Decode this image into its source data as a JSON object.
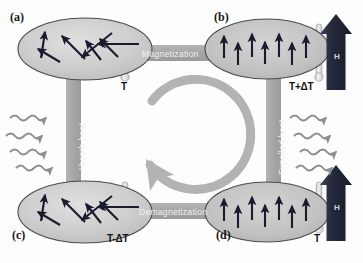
{
  "figure": {
    "width": 363,
    "height": 263,
    "background": "#fdfdfd"
  },
  "colors": {
    "band": "#a9a9a9",
    "band_dark": "#9a9a9a",
    "cycle_arrow": "#b3b3b3",
    "ellipse_fill": "#c8c8c8",
    "ellipse_fill_light": "#d2d2d2",
    "ellipse_stroke": "#4a4a4a",
    "spin_arrow": "#1b1b2e",
    "field_arrow": "#252a3c",
    "heat_wave": "#8e8e8e",
    "thermometer": "#e2e2e2",
    "thermometer_stroke": "#9c9c9c",
    "text_dark": "#141414",
    "text_light": "#f2f2f2"
  },
  "panels": [
    {
      "id": "a",
      "label": "(a)",
      "label_x": 10,
      "label_y": 16,
      "spin_state": "disordered",
      "ellipse": {
        "cx": 85,
        "cy": 49,
        "rx": 67,
        "ry": 31
      },
      "temperature": "T",
      "temperature_x": 121,
      "temperature_y": 79,
      "field_arrow": false,
      "spins": [
        {
          "x1": 41,
          "y1": 58,
          "x2": 45,
          "y2": 32
        },
        {
          "x1": 60,
          "y1": 62,
          "x2": 38,
          "y2": 49
        },
        {
          "x1": 85,
          "y1": 59,
          "x2": 62,
          "y2": 36
        },
        {
          "x1": 101,
          "y1": 60,
          "x2": 86,
          "y2": 41
        },
        {
          "x1": 118,
          "y1": 57,
          "x2": 100,
          "y2": 39
        },
        {
          "x1": 139,
          "y1": 44,
          "x2": 98,
          "y2": 44
        },
        {
          "x1": 112,
          "y1": 33,
          "x2": 82,
          "y2": 57
        }
      ]
    },
    {
      "id": "b",
      "label": "(b)",
      "label_x": 214,
      "label_y": 16,
      "spin_state": "ordered",
      "ellipse": {
        "cx": 267,
        "cy": 49,
        "rx": 62,
        "ry": 30
      },
      "temperature": "T+ΔT",
      "temperature_x": 289,
      "temperature_y": 79,
      "field_arrow": true,
      "spins": [
        {
          "x1": 224,
          "y1": 58,
          "x2": 224,
          "y2": 36
        },
        {
          "x1": 238,
          "y1": 65,
          "x2": 238,
          "y2": 43
        },
        {
          "x1": 252,
          "y1": 57,
          "x2": 252,
          "y2": 34
        },
        {
          "x1": 265,
          "y1": 64,
          "x2": 265,
          "y2": 42
        },
        {
          "x1": 279,
          "y1": 57,
          "x2": 279,
          "y2": 34
        },
        {
          "x1": 292,
          "y1": 65,
          "x2": 292,
          "y2": 43
        },
        {
          "x1": 306,
          "y1": 58,
          "x2": 306,
          "y2": 36
        }
      ]
    },
    {
      "id": "c",
      "label": "(c)",
      "label_x": 12,
      "label_y": 232,
      "spin_state": "disordered",
      "ellipse": {
        "cx": 85,
        "cy": 212,
        "rx": 67,
        "ry": 31
      },
      "temperature": "T-ΔT",
      "temperature_x": 107,
      "temperature_y": 231,
      "field_arrow": false,
      "spins": [
        {
          "x1": 41,
          "y1": 221,
          "x2": 45,
          "y2": 195
        },
        {
          "x1": 60,
          "y1": 225,
          "x2": 38,
          "y2": 212
        },
        {
          "x1": 85,
          "y1": 222,
          "x2": 62,
          "y2": 199
        },
        {
          "x1": 101,
          "y1": 223,
          "x2": 86,
          "y2": 204
        },
        {
          "x1": 118,
          "y1": 220,
          "x2": 100,
          "y2": 202
        },
        {
          "x1": 139,
          "y1": 207,
          "x2": 98,
          "y2": 207
        },
        {
          "x1": 112,
          "y1": 196,
          "x2": 82,
          "y2": 220
        }
      ]
    },
    {
      "id": "d",
      "label": "(d)",
      "label_x": 216,
      "label_y": 232,
      "spin_state": "ordered",
      "ellipse": {
        "cx": 267,
        "cy": 212,
        "rx": 62,
        "ry": 30
      },
      "temperature": "T",
      "temperature_x": 330,
      "temperature_y": 231,
      "field_arrow": true,
      "spins": [
        {
          "x1": 224,
          "y1": 221,
          "x2": 224,
          "y2": 199
        },
        {
          "x1": 238,
          "y1": 228,
          "x2": 238,
          "y2": 206
        },
        {
          "x1": 252,
          "y1": 220,
          "x2": 252,
          "y2": 197
        },
        {
          "x1": 265,
          "y1": 227,
          "x2": 265,
          "y2": 205
        },
        {
          "x1": 279,
          "y1": 220,
          "x2": 279,
          "y2": 197
        },
        {
          "x1": 292,
          "y1": 228,
          "x2": 292,
          "y2": 206
        },
        {
          "x1": 306,
          "y1": 221,
          "x2": 306,
          "y2": 199
        }
      ]
    }
  ],
  "process_bands": [
    {
      "name": "magnetization",
      "label": "Magnetization",
      "orientation": "horizontal",
      "x": 136,
      "y": 45,
      "width": 86,
      "height": 16,
      "label_x": 141,
      "label_y": 48
    },
    {
      "name": "demagnetization",
      "label": "Demagnetization",
      "orientation": "horizontal",
      "x": 134,
      "y": 203,
      "width": 96,
      "height": 16,
      "label_x": 138,
      "label_y": 206
    },
    {
      "name": "absorb-heat",
      "label": "Absorb heat",
      "orientation": "vertical",
      "x": 66,
      "y": 62,
      "width": 15,
      "height": 128,
      "label_x": 77,
      "label_y": 172
    },
    {
      "name": "expelled-heat",
      "label": "Expelled heat",
      "orientation": "vertical",
      "x": 266,
      "y": 62,
      "width": 15,
      "height": 128,
      "label_x": 277,
      "label_y": 175
    }
  ],
  "field_arrows": [
    {
      "panel": "b",
      "label": "H",
      "x": 336,
      "y": 14,
      "height": 76,
      "label_x": 343,
      "label_y": 56
    },
    {
      "panel": "d",
      "label": "H",
      "x": 336,
      "y": 165,
      "height": 76,
      "label_x": 343,
      "label_y": 207
    }
  ],
  "heat_waves": {
    "absorb": {
      "direction": "into-system",
      "items": [
        {
          "x": 10,
          "y": 118
        },
        {
          "x": 6,
          "y": 136
        },
        {
          "x": 10,
          "y": 152
        },
        {
          "x": 16,
          "y": 168
        }
      ]
    },
    "expelled": {
      "direction": "out-of-system",
      "items": [
        {
          "x": 290,
          "y": 118
        },
        {
          "x": 294,
          "y": 136
        },
        {
          "x": 300,
          "y": 152
        },
        {
          "x": 296,
          "y": 168
        }
      ]
    }
  },
  "cycle_arrow": {
    "name": "clockwise-cycle-arrow",
    "center_x": 182,
    "center_y": 131,
    "radius": 55,
    "stroke_width": 9,
    "direction": "clockwise"
  }
}
